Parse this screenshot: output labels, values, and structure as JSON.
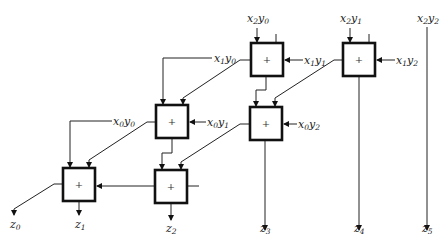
{
  "diagram": {
    "type": "adder array (partial products to sum bits)",
    "adders": [
      {
        "id": "A",
        "symbol": "+",
        "inputs": [
          "x2y0",
          "x1y1",
          "carry-in (top right)"
        ],
        "output_to": "D"
      },
      {
        "id": "B",
        "symbol": "+",
        "inputs": [
          "x2y1",
          "x1y2",
          "carry-in (top right)"
        ],
        "output_to": "z4"
      },
      {
        "id": "C",
        "symbol": "+",
        "inputs": [
          "x1y0",
          "x0y1"
        ],
        "output_to": "F"
      },
      {
        "id": "D",
        "symbol": "+",
        "inputs": [
          "A",
          "B",
          "x0y2"
        ],
        "output_to": "z3"
      },
      {
        "id": "E",
        "symbol": "+",
        "inputs": [
          "x0y0",
          "C",
          "F"
        ],
        "output_to": "z1"
      },
      {
        "id": "F",
        "symbol": "+",
        "inputs": [
          "C",
          "D"
        ],
        "output_to": "z2"
      }
    ],
    "input_labels": {
      "x2y0": {
        "base1": "x",
        "sub1": "2",
        "base2": "y",
        "sub2": "0"
      },
      "x2y1": {
        "base1": "x",
        "sub1": "2",
        "base2": "y",
        "sub2": "1"
      },
      "x2y2": {
        "base1": "x",
        "sub1": "2",
        "base2": "y",
        "sub2": "2"
      },
      "x1y0": {
        "base1": "x",
        "sub1": "1",
        "base2": "y",
        "sub2": "0"
      },
      "x1y1": {
        "base1": "x",
        "sub1": "1",
        "base2": "y",
        "sub2": "1"
      },
      "x1y2": {
        "base1": "x",
        "sub1": "1",
        "base2": "y",
        "sub2": "2"
      },
      "x0y0": {
        "base1": "x",
        "sub1": "0",
        "base2": "y",
        "sub2": "0"
      },
      "x0y1": {
        "base1": "x",
        "sub1": "0",
        "base2": "y",
        "sub2": "1"
      },
      "x0y2": {
        "base1": "x",
        "sub1": "0",
        "base2": "y",
        "sub2": "2"
      }
    },
    "outputs": [
      {
        "base": "z",
        "sub": "0"
      },
      {
        "base": "z",
        "sub": "1"
      },
      {
        "base": "z",
        "sub": "2"
      },
      {
        "base": "z",
        "sub": "3"
      },
      {
        "base": "z",
        "sub": "4"
      },
      {
        "base": "z",
        "sub": "5"
      }
    ],
    "adder_symbol": "+"
  }
}
